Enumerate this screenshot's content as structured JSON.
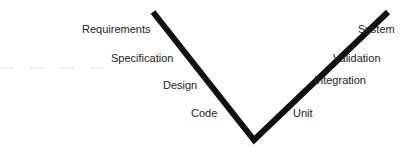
{
  "diagram": {
    "type": "V-model",
    "left_arm_labels": [
      {
        "text": "Requirements",
        "x": 82,
        "y": 23
      },
      {
        "text": "Specification",
        "x": 111,
        "y": 52
      },
      {
        "text": "Design",
        "x": 163,
        "y": 79
      },
      {
        "text": "Code",
        "x": 191,
        "y": 107
      }
    ],
    "right_arm_labels": [
      {
        "text": "System",
        "x": 358,
        "y": 23
      },
      {
        "text": "Validation",
        "x": 333,
        "y": 52
      },
      {
        "text": "Integration",
        "x": 314,
        "y": 74
      },
      {
        "text": "Unit",
        "x": 293,
        "y": 107
      }
    ],
    "v_shape": {
      "left_top": [
        153,
        12
      ],
      "vertex": [
        254,
        140
      ],
      "right_top": [
        388,
        12
      ],
      "stroke_color": "#111111",
      "stroke_width": 6
    }
  }
}
